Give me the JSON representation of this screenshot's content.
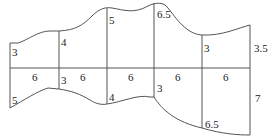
{
  "diagram": {
    "strip_width": 6,
    "upper": {
      "widths": [
        "6",
        "6",
        "6",
        "6",
        "6"
      ],
      "heights": [
        "3",
        "4",
        "5",
        "6.5",
        "3",
        "3.5"
      ]
    },
    "lower": {
      "widths": [
        "6",
        "6",
        "6",
        "6",
        "6"
      ],
      "heights": [
        "5",
        "3",
        "4",
        "3",
        "6.5",
        "7"
      ]
    },
    "labels": {
      "u0": "3",
      "u1": "4",
      "u2": "5",
      "u3": "6.5",
      "u4": "3",
      "u5": "3.5",
      "w0": "6",
      "w1": "6",
      "w2": "6",
      "w3": "6",
      "w4": "6",
      "l0": "5",
      "l1": "3",
      "l2": "4",
      "l3": "3",
      "l4": "6.5",
      "l5": "7"
    }
  }
}
